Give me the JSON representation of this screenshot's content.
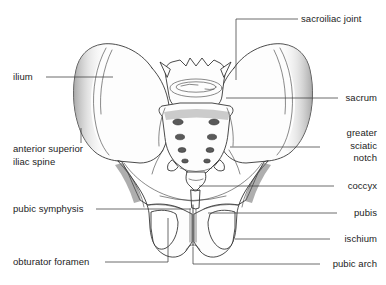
{
  "figure": {
    "background_color": "#ffffff",
    "line_color": "#2b2b2b",
    "text_color": "#1c1c1c",
    "width": 386,
    "height": 285
  },
  "labels": {
    "ilium": "ilium",
    "anterior_superior_iliac_spine_line1": "anterior superior",
    "anterior_superior_iliac_spine_line2": "iliac spine",
    "pubic_symphysis": "pubic symphysis",
    "obturator_foramen": "obturator foramen",
    "sacroiliac_joint": "sacroiliac joint",
    "sacrum": "sacrum",
    "greater_sciatic_notch_line1": "greater",
    "greater_sciatic_notch_line2": "sciatic",
    "greater_sciatic_notch_line3": "notch",
    "coccyx": "coccyx",
    "pubis": "pubis",
    "ischium": "ischium",
    "pubic_arch": "pubic arch"
  }
}
